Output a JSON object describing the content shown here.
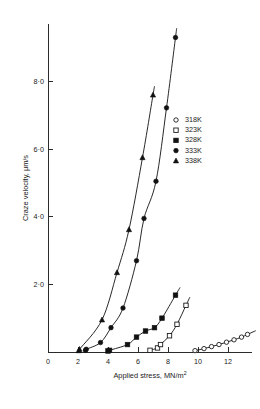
{
  "chart_data": {
    "type": "scatter",
    "title": "",
    "xlabel": "Applied stress, MN/m2",
    "xlabel_base": "Applied stress,  MN/m",
    "xlabel_exp": "2",
    "ylabel": "Craze velocity, μm/s",
    "xlim": [
      0,
      13.6
    ],
    "ylim": [
      0,
      9.7
    ],
    "xticks": [
      0,
      2,
      4,
      6,
      8,
      10,
      12
    ],
    "xtick_labels": [
      "0",
      "2",
      "4",
      "6",
      "8",
      "10",
      "12"
    ],
    "yticks": [
      2.0,
      4.0,
      6.0,
      8.0
    ],
    "ytick_labels": [
      "2·0",
      "4·0",
      "6·0",
      "8·0"
    ],
    "grid": false,
    "legend_position": "center-right",
    "series": [
      {
        "name": "318K",
        "marker": "open-circle",
        "color": "#111111",
        "x": [
          9.8,
          10.4,
          10.9,
          11.4,
          11.9,
          12.4,
          12.9,
          13.3
        ],
        "y": [
          0.04,
          0.1,
          0.16,
          0.22,
          0.29,
          0.36,
          0.44,
          0.52
        ]
      },
      {
        "name": "323K",
        "marker": "open-square",
        "color": "#111111",
        "x": [
          6.8,
          7.3,
          7.5,
          8.1,
          8.6,
          9.2
        ],
        "y": [
          0.05,
          0.12,
          0.22,
          0.48,
          0.82,
          1.38
        ]
      },
      {
        "name": "328K",
        "marker": "filled-square",
        "color": "#111111",
        "x": [
          4.0,
          4.1,
          5.3,
          5.9,
          6.5,
          7.1,
          7.6,
          8.5
        ],
        "y": [
          0.03,
          0.05,
          0.22,
          0.44,
          0.62,
          0.72,
          1.0,
          1.68
        ]
      },
      {
        "name": "333K",
        "marker": "filled-circle",
        "color": "#111111",
        "x": [
          2.5,
          2.55,
          3.5,
          4.2,
          5.0,
          5.9,
          6.4,
          7.2,
          7.9,
          8.5
        ],
        "y": [
          0.05,
          0.08,
          0.28,
          0.72,
          1.3,
          2.7,
          3.95,
          5.05,
          7.22,
          9.3
        ]
      },
      {
        "name": "338K",
        "marker": "filled-triangle",
        "color": "#111111",
        "x": [
          2.05,
          2.1,
          3.6,
          4.6,
          5.4,
          6.3,
          7.0
        ],
        "y": [
          0.04,
          0.08,
          0.95,
          2.35,
          3.62,
          5.75,
          7.6
        ]
      }
    ],
    "legend": [
      {
        "label": "318K",
        "marker": "open-circle"
      },
      {
        "label": "323K",
        "marker": "open-square"
      },
      {
        "label": "328K",
        "marker": "filled-square"
      },
      {
        "label": "333K",
        "marker": "filled-circle"
      },
      {
        "label": "338K",
        "marker": "filled-triangle"
      }
    ]
  }
}
